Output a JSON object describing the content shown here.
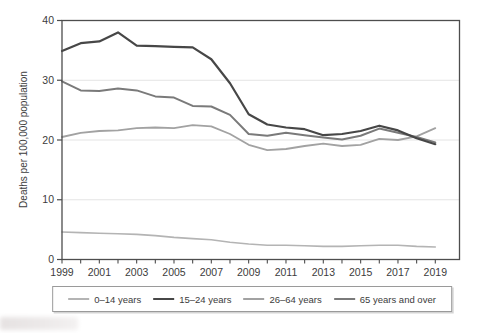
{
  "chart_data": {
    "type": "line",
    "title": "",
    "xlabel": "",
    "ylabel": "Deaths per 100,000 population",
    "x": [
      1999,
      2000,
      2001,
      2002,
      2003,
      2004,
      2005,
      2006,
      2007,
      2008,
      2009,
      2010,
      2011,
      2012,
      2013,
      2014,
      2015,
      2016,
      2017,
      2018,
      2019
    ],
    "xtick_labels": [
      "1999",
      "2001",
      "2003",
      "2005",
      "2007",
      "2009",
      "2011",
      "2013",
      "2015",
      "2017",
      "2019"
    ],
    "yticks": [
      0,
      10,
      20,
      30,
      40
    ],
    "ylim": [
      0,
      40
    ],
    "grid": "horizontal",
    "legend_position": "bottom",
    "series": [
      {
        "name": "0–14 years",
        "color": "#b4b4b4",
        "values": [
          4.6,
          4.5,
          4.4,
          4.3,
          4.2,
          4.0,
          3.7,
          3.5,
          3.3,
          2.9,
          2.6,
          2.4,
          2.4,
          2.3,
          2.2,
          2.2,
          2.3,
          2.4,
          2.4,
          2.2,
          2.1
        ]
      },
      {
        "name": "15–24 years",
        "color": "#474747",
        "values": [
          34.9,
          36.2,
          36.5,
          38.0,
          35.8,
          35.7,
          35.6,
          35.5,
          33.5,
          29.5,
          24.3,
          22.6,
          22.1,
          21.8,
          20.8,
          21.0,
          21.5,
          22.4,
          21.6,
          20.3,
          19.3
        ]
      },
      {
        "name": "26–64 years",
        "color": "#a2a2a2",
        "values": [
          20.5,
          21.2,
          21.5,
          21.6,
          22.0,
          22.1,
          22.0,
          22.5,
          22.3,
          21.0,
          19.2,
          18.3,
          18.5,
          19.0,
          19.4,
          19.0,
          19.2,
          20.2,
          20.0,
          20.6,
          22.0
        ]
      },
      {
        "name": "65 years and over",
        "color": "#7a7a7a",
        "values": [
          29.8,
          28.3,
          28.2,
          28.6,
          28.3,
          27.3,
          27.1,
          25.7,
          25.6,
          24.2,
          21.0,
          20.7,
          21.2,
          20.8,
          20.4,
          20.1,
          20.7,
          21.9,
          21.2,
          20.5,
          19.6
        ]
      }
    ]
  },
  "colors": {
    "axis_box": "#4d4d4d",
    "gridline": "#e4e4e4",
    "tick_text": "#3c3c3c",
    "legend_border": "#9a9a9a"
  }
}
